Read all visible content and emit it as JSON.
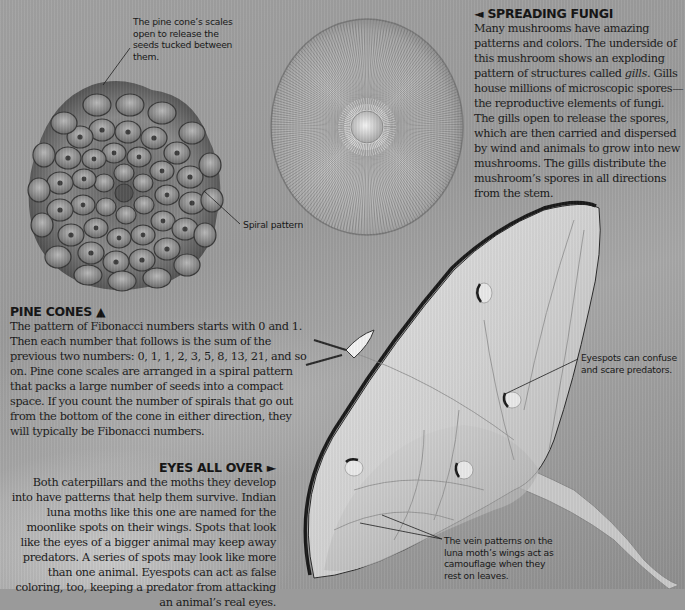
{
  "captions": {
    "pine_cone_scales": "The pine cone’s scales open to release the seeds tucked between them.",
    "spiral_pattern": "Spiral pattern",
    "eyespots": "Eyespots can confuse and scare predators.",
    "vein_patterns": "The vein patterns on the luna moth’s wings act as camouflage when they rest on leaves."
  },
  "sections": {
    "spreading_fungi": {
      "arrow": "◄",
      "title": "SPREADING FUNGI",
      "body_before_italic": "Many mushrooms have amazing patterns and colors. The underside of this mushroom shows an exploding pattern of structures called ",
      "italic_term": "gills",
      "body_after_italic": ". Gills house millions of microscopic spores—the reproductive elements of fungi. The gills open to release the spores, which are then carried and dispersed by wind and animals to grow into new mushrooms. The gills distribute the mushroom’s spores in all directions from the stem."
    },
    "pine_cones": {
      "title": "PINE CONES",
      "arrow": "▲",
      "body": "The pattern of Fibonacci numbers starts with 0 and 1. Then each number that follows is the sum of the previous two numbers: 0, 1, 1, 2, 3, 5, 8, 13, 21, and so on. Pine cone scales are arranged in a spiral pattern that packs a large number of seeds into a compact space. If you count the number of spirals that go out from the bottom of the cone in either direction, they will typically be Fibonacci numbers."
    },
    "eyes_all_over": {
      "title": "EYES ALL OVER",
      "arrow": "►",
      "body": "Both caterpillars and the moths they develop into have patterns that help them survive. Indian luna moths like this one are named for the moonlike spots on their wings. Spots that look like the eyes of a bigger animal may keep away predators. A series of spots may look like more than one animal. Eyespots can act as false coloring, too, keeping a predator from attacking an animal’s real eyes."
    }
  },
  "images": {
    "pine_cone": "pine-cone-photo",
    "mushroom": "mushroom-gills-photo",
    "moth": "luna-moth-photo"
  }
}
